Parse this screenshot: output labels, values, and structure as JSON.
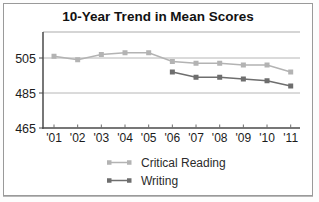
{
  "title": "10-Year Trend in Mean Scores",
  "chart_data": {
    "type": "line",
    "categories": [
      "'01",
      "'02",
      "'03",
      "'04",
      "'05",
      "'06",
      "'07",
      "'08",
      "'09",
      "'10",
      "'11"
    ],
    "series": [
      {
        "name": "Critical Reading",
        "color": "#b3b3b3",
        "values": [
          506,
          504,
          507,
          508,
          508,
          503,
          502,
          502,
          501,
          501,
          497
        ]
      },
      {
        "name": "Writing",
        "color": "#6e6e6e",
        "values": [
          null,
          null,
          null,
          null,
          null,
          497,
          494,
          494,
          493,
          492,
          489
        ]
      }
    ],
    "yticks": [
      505,
      485,
      465
    ],
    "ylim": [
      465,
      520
    ],
    "grid": true,
    "legend_position": "bottom",
    "marker": "square"
  }
}
